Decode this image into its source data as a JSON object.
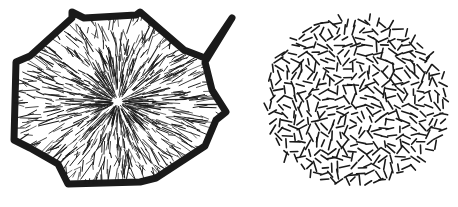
{
  "figure": {
    "background": "#ffffff",
    "ink": "#1a1a1a",
    "panels": [
      {
        "id": "radial-spherulite",
        "description": "Radial fibrous crystal aggregate with dark polygonal boundary",
        "center": [
          118,
          102
        ],
        "boundary": [
          [
            72,
            12
          ],
          [
            84,
            18
          ],
          [
            136,
            15
          ],
          [
            140,
            12
          ],
          [
            184,
            50
          ],
          [
            205,
            58
          ],
          [
            232,
            18
          ],
          [
            205,
            62
          ],
          [
            212,
            90
          ],
          [
            226,
            112
          ],
          [
            216,
            120
          ],
          [
            205,
            146
          ],
          [
            156,
            178
          ],
          [
            140,
            182
          ],
          [
            68,
            184
          ],
          [
            58,
            164
          ],
          [
            30,
            148
          ],
          [
            14,
            140
          ],
          [
            16,
            62
          ],
          [
            30,
            56
          ],
          [
            72,
            18
          ]
        ]
      },
      {
        "id": "random-needles",
        "description": "Circular cluster of short randomly oriented needles",
        "center": [
          356,
          102
        ],
        "radius": [
          92,
          86
        ]
      }
    ]
  }
}
